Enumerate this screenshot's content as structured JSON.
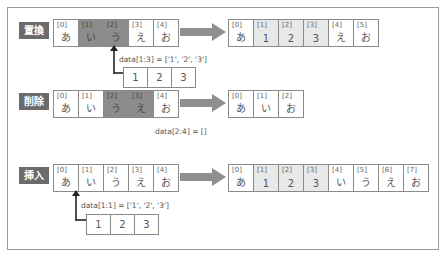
{
  "sections": [
    {
      "label": "置換",
      "before": [
        {
          "index": "[0]",
          "value": "あ",
          "state": "normal"
        },
        {
          "index": "[1]",
          "value": "い",
          "state": "highlight"
        },
        {
          "index": "[2]",
          "value": "う",
          "state": "highlight"
        },
        {
          "index": "[3]",
          "value": "え",
          "state": "normal"
        },
        {
          "index": "[4]",
          "value": "お",
          "state": "normal"
        }
      ],
      "code": "data[1:3] = ['1', '2', '3']",
      "inserted": [
        "1",
        "2",
        "3"
      ],
      "after": [
        {
          "index": "[0]",
          "value": "あ",
          "state": "normal"
        },
        {
          "index": "[1]",
          "value": "1",
          "state": "new"
        },
        {
          "index": "[2]",
          "value": "2",
          "state": "new"
        },
        {
          "index": "[3]",
          "value": "3",
          "state": "new"
        },
        {
          "index": "[4]",
          "value": "え",
          "state": "normal"
        },
        {
          "index": "[5]",
          "value": "お",
          "state": "normal"
        }
      ]
    },
    {
      "label": "削除",
      "before": [
        {
          "index": "[0]",
          "value": "あ",
          "state": "normal"
        },
        {
          "index": "[1]",
          "value": "い",
          "state": "normal"
        },
        {
          "index": "[2]",
          "value": "う",
          "state": "highlight"
        },
        {
          "index": "[3]",
          "value": "え",
          "state": "highlight"
        },
        {
          "index": "[4]",
          "value": "お",
          "state": "normal"
        }
      ],
      "code": "data[2:4] = []",
      "after": [
        {
          "index": "[0]",
          "value": "あ",
          "state": "normal"
        },
        {
          "index": "[1]",
          "value": "い",
          "state": "normal"
        },
        {
          "index": "[2]",
          "value": "お",
          "state": "normal"
        }
      ]
    },
    {
      "label": "挿入",
      "before": [
        {
          "index": "[0]",
          "value": "あ",
          "state": "normal"
        },
        {
          "index": "[1]",
          "value": "い",
          "state": "normal"
        },
        {
          "index": "[2]",
          "value": "う",
          "state": "normal"
        },
        {
          "index": "[3]",
          "value": "え",
          "state": "normal"
        },
        {
          "index": "[4]",
          "value": "お",
          "state": "normal"
        }
      ],
      "code": "data[1:1] = ['1', '2', '3']",
      "inserted": [
        "1",
        "2",
        "3"
      ],
      "after": [
        {
          "index": "[0]",
          "value": "あ",
          "state": "normal"
        },
        {
          "index": "[1]",
          "value": "1",
          "state": "new"
        },
        {
          "index": "[2]",
          "value": "2",
          "state": "new"
        },
        {
          "index": "[3]",
          "value": "3",
          "state": "new"
        },
        {
          "index": "[4]",
          "value": "い",
          "state": "normal"
        },
        {
          "index": "[5]",
          "value": "う",
          "state": "normal"
        },
        {
          "index": "[6]",
          "value": "え",
          "state": "normal"
        },
        {
          "index": "[7]",
          "value": "お",
          "state": "normal"
        }
      ]
    }
  ],
  "colors": {
    "label_bg": "#6b6b6b",
    "highlight_cell": "#8c8c8c",
    "new_cell": "#e8e8e8",
    "arrow": "#8f8f8f",
    "border": "#8a8a8a"
  }
}
